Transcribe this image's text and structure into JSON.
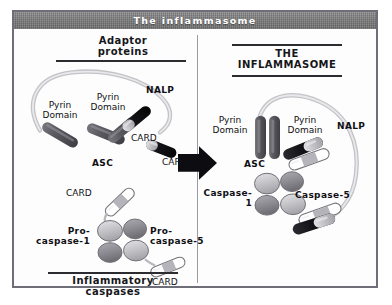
{
  "figure": {
    "title": "The inflammasome"
  },
  "left_panel": {
    "heading": "Adaptor\nproteins",
    "footer_heading": "Inflammatory\ncaspases",
    "nalp_label": "NALP",
    "asc_label": "ASC",
    "pyrin_domain_1": "Pyrin\nDomain",
    "pyrin_domain_2": "Pyrin\nDomain",
    "card_nalp": "CARD",
    "card_asc": "CARD",
    "procaspase_1": "Pro-\ncaspase-1",
    "procaspase_5": "Pro-\ncaspase-5",
    "card_procaspase_1": "CARD",
    "card_procaspase_5": "CARD"
  },
  "right_panel": {
    "heading": "THE\nINFLAMMASOME",
    "nalp_label": "NALP",
    "asc_label": "ASC",
    "pyrin_domain_1": "Pyrin\nDomain",
    "pyrin_domain_2": "Pyrin\nDomain",
    "caspase_1": "Caspase-1",
    "caspase_5": "Caspase-5"
  },
  "arrow": {
    "name": "assembly-arrow",
    "direction": "right"
  },
  "colors": {
    "titlebar": "#7b7b7b",
    "title_text": "#ffffff",
    "frame_border": "#6e6e78",
    "background": "#fdfdfd",
    "text": "#101014",
    "rule": "#2b2b30",
    "pyrin_domain": "#5a5a60",
    "card_dark": "#121216",
    "card_light": "#c9c9cd",
    "nalp_filament": "#c4c4c8",
    "caspase_oval_light": "#c6c6ca",
    "caspase_oval_dark": "#8e8e94",
    "arrow": "#0d0d11"
  }
}
